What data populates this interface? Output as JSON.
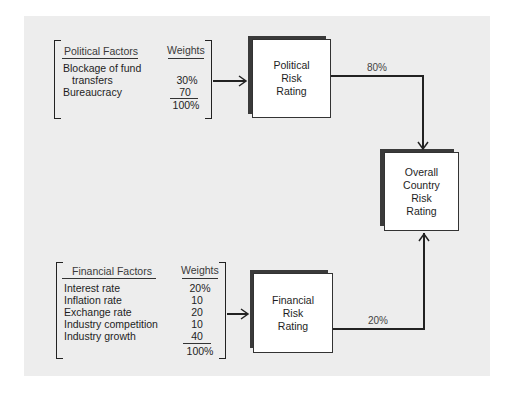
{
  "political": {
    "header_factor": "Political Factors",
    "header_weight": "Weights",
    "rows": [
      {
        "factor_line1": "Blockage of fund",
        "factor_line2": "transfers",
        "weight": "30%"
      },
      {
        "factor": "Bureaucracy",
        "weight": "70"
      }
    ],
    "total": "100%"
  },
  "financial": {
    "header_factor": "Financial Factors",
    "header_weight": "Weights",
    "rows": [
      {
        "factor": "Interest rate",
        "weight": "20%"
      },
      {
        "factor": "Inflation rate",
        "weight": "10"
      },
      {
        "factor": "Exchange rate",
        "weight": "20"
      },
      {
        "factor": "Industry competition",
        "weight": "10"
      },
      {
        "factor": "Industry growth",
        "weight": "40"
      }
    ],
    "total": "100%"
  },
  "boxes": {
    "political_rating": [
      "Political",
      "Risk",
      "Rating"
    ],
    "financial_rating": [
      "Financial",
      "Risk",
      "Rating"
    ],
    "overall_rating": [
      "Overall",
      "Country",
      "Risk",
      "Rating"
    ]
  },
  "edges": {
    "political_to_overall": "80%",
    "financial_to_overall": "20%"
  },
  "colors": {
    "background": "#ededed",
    "box_shadow": "#3a3a3a",
    "line": "#222222"
  }
}
